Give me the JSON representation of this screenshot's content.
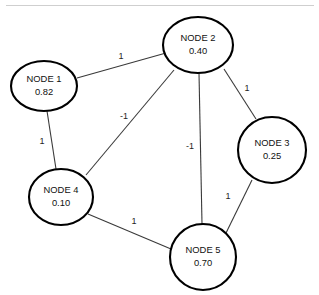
{
  "diagram": {
    "background_color": "#ffffff",
    "node_stroke_color": "#000000",
    "edge_stroke_color": "#3a3a3a",
    "divider_color": "#cfcfcf"
  },
  "nodes": [
    {
      "id": "node-1",
      "label": "NODE 1",
      "value": "0.82",
      "cx": 44,
      "cy": 86,
      "rx": 33,
      "ry": 25
    },
    {
      "id": "node-2",
      "label": "NODE 2",
      "value": "0.40",
      "cx": 198,
      "cy": 45,
      "rx": 35,
      "ry": 28
    },
    {
      "id": "node-3",
      "label": "NODE 3",
      "value": "0.25",
      "cx": 272,
      "cy": 150,
      "rx": 34,
      "ry": 33
    },
    {
      "id": "node-4",
      "label": "NODE 4",
      "value": "0.10",
      "cx": 61,
      "cy": 197,
      "rx": 32,
      "ry": 28
    },
    {
      "id": "node-5",
      "label": "NODE 5",
      "value": "0.70",
      "cx": 203,
      "cy": 257,
      "rx": 33,
      "ry": 33
    }
  ],
  "edges": [
    {
      "id": "edge-1-2",
      "source": "node-1",
      "target": "node-2",
      "weight": "1",
      "x1": 77,
      "y1": 78,
      "x2": 166,
      "y2": 53,
      "lx": 121,
      "ly": 57
    },
    {
      "id": "edge-1-4",
      "source": "node-1",
      "target": "node-4",
      "weight": "1",
      "x1": 47,
      "y1": 111,
      "x2": 56,
      "y2": 169,
      "lx": 42,
      "ly": 142
    },
    {
      "id": "edge-2-3",
      "source": "node-2",
      "target": "node-3",
      "weight": "1",
      "x1": 224,
      "y1": 69,
      "x2": 256,
      "y2": 119,
      "lx": 247,
      "ly": 89
    },
    {
      "id": "edge-2-4",
      "source": "node-2",
      "target": "node-4",
      "weight": "-1",
      "x1": 174,
      "y1": 70,
      "x2": 86,
      "y2": 175,
      "lx": 124,
      "ly": 117
    },
    {
      "id": "edge-2-5",
      "source": "node-2",
      "target": "node-5",
      "weight": "-1",
      "x1": 199,
      "y1": 73,
      "x2": 202,
      "y2": 224,
      "lx": 190,
      "ly": 147
    },
    {
      "id": "edge-3-5",
      "source": "node-3",
      "target": "node-5",
      "weight": "1",
      "x1": 252,
      "y1": 180,
      "x2": 226,
      "y2": 233,
      "lx": 228,
      "ly": 197
    },
    {
      "id": "edge-4-5",
      "source": "node-4",
      "target": "node-5",
      "weight": "1",
      "x1": 88,
      "y1": 214,
      "x2": 171,
      "y2": 249,
      "lx": 134,
      "ly": 222
    }
  ],
  "divider": {
    "x1": 6,
    "y1": 5.5,
    "x2": 314,
    "y2": 5.5
  }
}
